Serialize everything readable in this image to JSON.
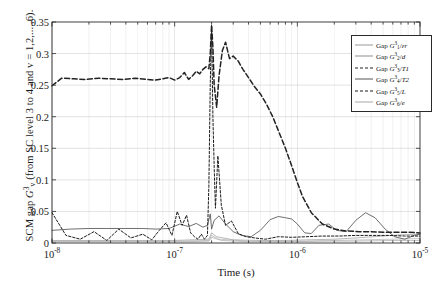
{
  "figure": {
    "background": "#ffffff",
    "frame_color": "#2a2a2a",
    "grid_color": "#c8c8c8"
  },
  "axes": {
    "xlabel": "Time (s)",
    "ylabel_parts": {
      "prefix": "SCM gap ",
      "symbol": "G",
      "sup": "3",
      "sub": "v",
      "suffix": " (from SC level 3 to 4 and v = 1,2,....,6)."
    },
    "ylabel_plain": "SCM gap G3v (from SC level 3 to 4 and v = 1,2,....,6).",
    "y_ticks": [
      "0",
      "0.05",
      "0.1",
      "0.15",
      "0.2",
      "0.25",
      "0.3",
      "0.35"
    ],
    "y_tick_values": [
      0,
      0.05,
      0.1,
      0.15,
      0.2,
      0.25,
      0.3,
      0.35
    ],
    "ylim": [
      0,
      0.35
    ],
    "x_ticks": [
      {
        "mantissa": "10",
        "exponent": "-8",
        "value": 1e-08
      },
      {
        "mantissa": "10",
        "exponent": "-7",
        "value": 1e-07
      },
      {
        "mantissa": "10",
        "exponent": "-6",
        "value": 1e-06
      },
      {
        "mantissa": "10",
        "exponent": "-5",
        "value": 1e-05
      }
    ],
    "xlim": [
      1e-08,
      1e-05
    ],
    "xscale": "log",
    "grid": true
  },
  "legend": {
    "position": "upper-right",
    "items": [
      {
        "label_prefix": "Gap ",
        "symbol": "G",
        "sup": "3",
        "sub": "1",
        "denom": "εr",
        "style": "solid-thin",
        "color": "#8f8f8f",
        "name": "epsilon-r"
      },
      {
        "label_prefix": "Gap ",
        "symbol": "G",
        "sup": "3",
        "sub": "2",
        "denom": "d",
        "style": "solid-thin",
        "color": "#8f8f8f",
        "name": "d"
      },
      {
        "label_prefix": "Gap ",
        "symbol": "G",
        "sup": "3",
        "sub": "3",
        "denom": "T1",
        "style": "dash-dot",
        "color": "#222222",
        "name": "T1"
      },
      {
        "label_prefix": "Gap ",
        "symbol": "G",
        "sup": "3",
        "sub": "4",
        "denom": "T2",
        "style": "solid-medium",
        "color": "#555555",
        "name": "T2"
      },
      {
        "label_prefix": "Gap ",
        "symbol": "G",
        "sup": "3",
        "sub": "5",
        "denom": "L",
        "style": "dashed-small",
        "color": "#1a1a1a",
        "name": "L"
      },
      {
        "label_prefix": "Gap ",
        "symbol": "G",
        "sup": "3",
        "sub": "6",
        "denom": "e",
        "style": "solid-thin",
        "color": "#a0a0a0",
        "name": "e"
      }
    ]
  },
  "chart_data": {
    "type": "line",
    "title": "",
    "xlabel": "Time (s)",
    "ylabel": "SCM gap G3v (from SC level 3 to 4 and v = 1,2,....,6).",
    "xscale": "log",
    "xlim": [
      1e-08,
      1e-05
    ],
    "ylim": [
      0,
      0.35
    ],
    "grid": true,
    "legend_position": "upper-right",
    "series": [
      {
        "name": "Gap G3_3/T1",
        "style": "dash-dot",
        "color": "#222222",
        "x": [
          1e-08,
          1.2e-08,
          1.5e-08,
          1.9e-08,
          2.4e-08,
          3e-08,
          3.8e-08,
          4.8e-08,
          6e-08,
          7e-08,
          8e-08,
          9e-08,
          1e-07,
          1.1e-07,
          1.2e-07,
          1.3e-07,
          1.4e-07,
          1.5e-07,
          1.6e-07,
          1.7e-07,
          1.8e-07,
          1.9e-07,
          1.95e-07,
          2e-07,
          2.05e-07,
          2.1e-07,
          2.2e-07,
          2.3e-07,
          2.45e-07,
          2.6e-07,
          2.8e-07,
          3e-07,
          3.3e-07,
          3.6e-07,
          4e-07,
          4.5e-07,
          5e-07,
          5.6e-07,
          6.3e-07,
          7e-07,
          8e-07,
          9e-07,
          1e-06,
          1.1e-06,
          1.3e-06,
          1.6e-06,
          2e-06,
          2.5e-06,
          3.2e-06,
          4e-06,
          5e-06,
          6.3e-06,
          8e-06,
          1e-05
        ],
        "y": [
          0.249,
          0.261,
          0.26,
          0.259,
          0.261,
          0.26,
          0.259,
          0.261,
          0.259,
          0.258,
          0.26,
          0.262,
          0.258,
          0.262,
          0.27,
          0.259,
          0.265,
          0.272,
          0.268,
          0.275,
          0.279,
          0.276,
          0.3,
          0.345,
          0.31,
          0.25,
          0.215,
          0.265,
          0.305,
          0.318,
          0.292,
          0.296,
          0.288,
          0.275,
          0.262,
          0.247,
          0.236,
          0.22,
          0.2,
          0.178,
          0.15,
          0.122,
          0.096,
          0.074,
          0.048,
          0.03,
          0.022,
          0.019,
          0.018,
          0.018,
          0.017,
          0.017,
          0.017,
          0.016
        ]
      },
      {
        "name": "Gap G3_5/L",
        "style": "dashed-small",
        "color": "#1a1a1a",
        "x": [
          1e-08,
          1.3e-08,
          1.7e-08,
          2.2e-08,
          2.8e-08,
          3.5e-08,
          4.4e-08,
          5.5e-08,
          6.5e-08,
          7.5e-08,
          8.5e-08,
          9.5e-08,
          1.05e-07,
          1.15e-07,
          1.25e-07,
          1.35e-07,
          1.45e-07,
          1.55e-07,
          1.65e-07,
          1.75e-07,
          1.85e-07,
          1.9e-07,
          1.95e-07,
          2e-07,
          2.05e-07,
          2.1e-07,
          2.15e-07,
          2.25e-07,
          2.4e-07,
          2.6e-07,
          2.9e-07,
          3.3e-07,
          3.8e-07,
          4.5e-07,
          5.5e-07,
          7e-07,
          9e-07,
          1.2e-06,
          1.6e-06,
          2.2e-06,
          3e-06,
          4e-06,
          5.5e-06,
          7.5e-06,
          1e-05
        ],
        "y": [
          0.048,
          0.012,
          0.006,
          0.018,
          0.004,
          0.022,
          0.008,
          0.014,
          0.005,
          0.02,
          0.032,
          0.012,
          0.05,
          0.028,
          0.044,
          0.016,
          0.01,
          0.006,
          0.014,
          0.006,
          0.012,
          0.09,
          0.25,
          0.345,
          0.2,
          0.12,
          0.055,
          0.138,
          0.06,
          0.028,
          0.035,
          0.015,
          0.01,
          0.008,
          0.006,
          0.01,
          0.009,
          0.01,
          0.011,
          0.011,
          0.012,
          0.012,
          0.012,
          0.011,
          0.011
        ]
      },
      {
        "name": "Gap G3_4/T2",
        "style": "solid-medium",
        "color": "#555555",
        "x": [
          1e-08,
          1.4e-08,
          2e-08,
          2.8e-08,
          4e-08,
          5.5e-08,
          7e-08,
          9e-08,
          1.1e-07,
          1.3e-07,
          1.5e-07,
          1.7e-07,
          1.85e-07,
          1.95e-07,
          2e-07,
          2.1e-07,
          2.3e-07,
          2.6e-07,
          3e-07,
          3.5e-07,
          4.2e-07,
          5e-07,
          6e-07,
          7e-07,
          8e-07,
          9e-07,
          1e-06,
          1.15e-06,
          1.3e-06,
          1.5e-06,
          1.8e-06,
          2.1e-06,
          2.5e-06,
          3e-06,
          3.6e-06,
          4.3e-06,
          5.2e-06,
          6.2e-06,
          7.5e-06,
          9e-06,
          1e-05
        ],
        "y": [
          0.02,
          0.022,
          0.023,
          0.023,
          0.023,
          0.023,
          0.022,
          0.023,
          0.03,
          0.026,
          0.031,
          0.025,
          0.028,
          0.046,
          0.022,
          0.036,
          0.043,
          0.03,
          0.018,
          0.012,
          0.01,
          0.02,
          0.037,
          0.042,
          0.04,
          0.038,
          0.03,
          0.016,
          0.015,
          0.028,
          0.03,
          0.02,
          0.018,
          0.036,
          0.048,
          0.04,
          0.022,
          0.01,
          0.006,
          0.012,
          0.014
        ]
      },
      {
        "name": "Gap G3_1/epsilon-r",
        "style": "solid-thin",
        "color": "#9a9a9a",
        "x": [
          1e-08,
          3e-08,
          1e-07,
          1.9e-07,
          2e-07,
          2.2e-07,
          3e-07,
          5e-07,
          8e-07,
          1.2e-06,
          2e-06,
          3e-06,
          5e-06,
          7e-06,
          1e-05
        ],
        "y": [
          0.004,
          0.004,
          0.004,
          0.006,
          0.016,
          0.01,
          0.005,
          0.004,
          0.004,
          0.005,
          0.006,
          0.008,
          0.011,
          0.013,
          0.014
        ]
      },
      {
        "name": "Gap G3_2/d",
        "style": "solid-thin",
        "color": "#b0b0b0",
        "x": [
          1e-08,
          5e-08,
          1e-07,
          1.9e-07,
          2e-07,
          2.3e-07,
          4e-07,
          7e-07,
          1.2e-06,
          2e-06,
          3.5e-06,
          6e-06,
          1e-05
        ],
        "y": [
          0.003,
          0.003,
          0.003,
          0.004,
          0.012,
          0.006,
          0.003,
          0.003,
          0.003,
          0.004,
          0.005,
          0.006,
          0.007
        ]
      },
      {
        "name": "Gap G3_6/e",
        "style": "solid-thin",
        "color": "#a8a8a8",
        "x": [
          1e-08,
          6e-08,
          1.2e-07,
          1.9e-07,
          2e-07,
          2.4e-07,
          4e-07,
          8e-07,
          1.5e-06,
          3e-06,
          6e-06,
          1e-05
        ],
        "y": [
          0.002,
          0.002,
          0.002,
          0.003,
          0.009,
          0.004,
          0.002,
          0.002,
          0.003,
          0.003,
          0.004,
          0.004
        ]
      }
    ]
  }
}
